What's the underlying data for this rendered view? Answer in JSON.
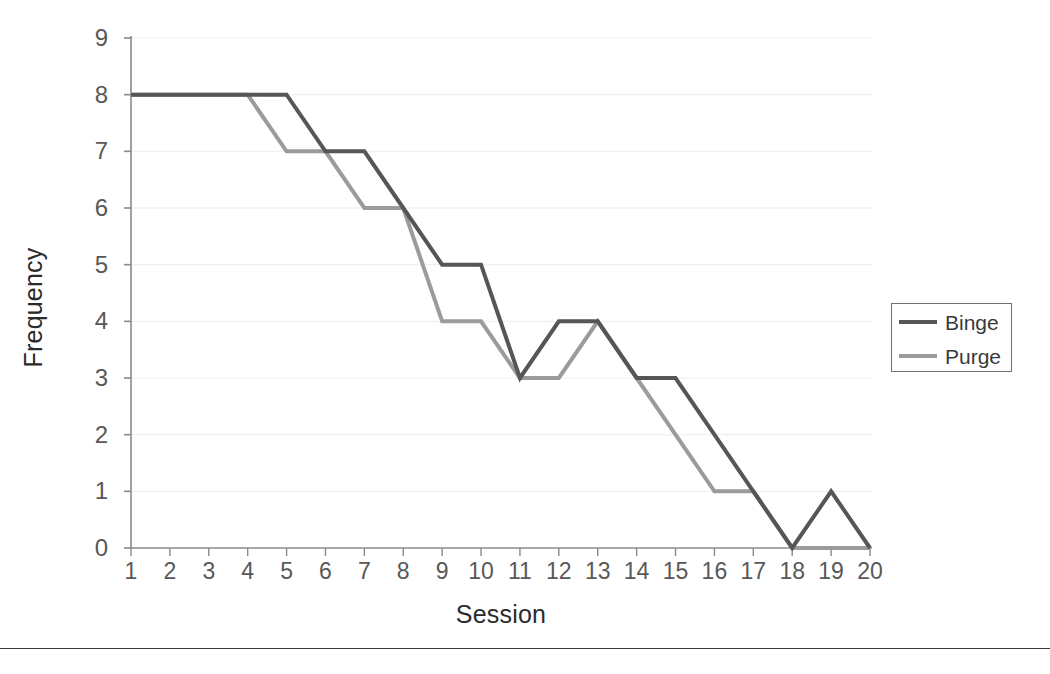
{
  "chart_data": {
    "type": "line",
    "title": "",
    "xlabel": "Session",
    "ylabel": "Frequency",
    "x": [
      1,
      2,
      3,
      4,
      5,
      6,
      7,
      8,
      9,
      10,
      11,
      12,
      13,
      14,
      15,
      16,
      17,
      18,
      19,
      20
    ],
    "categories": [
      "1",
      "2",
      "3",
      "4",
      "5",
      "6",
      "7",
      "8",
      "9",
      "10",
      "11",
      "12",
      "13",
      "14",
      "15",
      "16",
      "17",
      "18",
      "19",
      "20"
    ],
    "xlim": [
      1,
      20
    ],
    "ylim": [
      0,
      9
    ],
    "yticks": [
      0,
      1,
      2,
      3,
      4,
      5,
      6,
      7,
      8,
      9
    ],
    "ytick_labels": [
      "0",
      "1",
      "2",
      "3",
      "4",
      "5",
      "6",
      "7",
      "8",
      "9"
    ],
    "grid": true,
    "grid_axis": "y",
    "legend_position": "right",
    "series": [
      {
        "name": "Binge",
        "color": "#565656",
        "values": [
          8,
          8,
          8,
          8,
          8,
          7,
          7,
          6,
          5,
          5,
          3,
          4,
          4,
          3,
          3,
          2,
          1,
          0,
          1,
          0
        ]
      },
      {
        "name": "Purge",
        "color": "#9b9b9b",
        "values": [
          8,
          8,
          8,
          8,
          7,
          7,
          6,
          6,
          4,
          4,
          3,
          3,
          4,
          3,
          2,
          1,
          1,
          0,
          0,
          0
        ]
      }
    ]
  },
  "axes": {
    "x_title": "Session",
    "y_title": "Frequency"
  },
  "legend": {
    "entries": [
      {
        "label": "Binge",
        "color": "#565656"
      },
      {
        "label": "Purge",
        "color": "#9b9b9b"
      }
    ]
  },
  "colors": {
    "binge": "#565656",
    "purge": "#9b9b9b",
    "axis": "#8a8a8a",
    "grid": "#ededed",
    "text": "#585858",
    "title_text": "#2b2b2b",
    "rule": "#3c3c3c"
  }
}
